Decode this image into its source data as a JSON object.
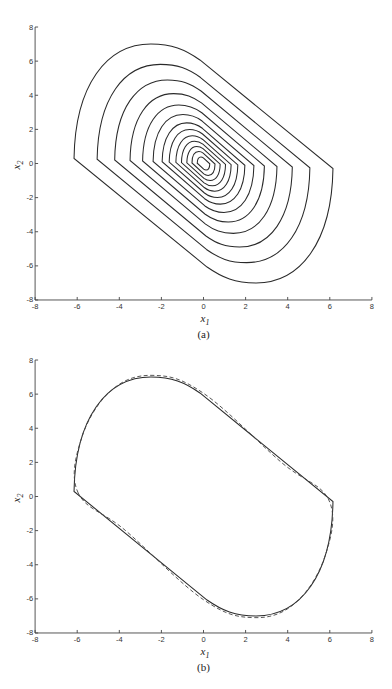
{
  "chart_data": [
    {
      "panel": "a",
      "type": "line",
      "caption": "(a)",
      "title": "",
      "xlabel": "x1",
      "ylabel": "x2",
      "xlim": [
        -8,
        8
      ],
      "ylim": [
        -8,
        8
      ],
      "xticks": [
        -8,
        -6,
        -4,
        -2,
        0,
        2,
        4,
        6,
        8
      ],
      "yticks": [
        -8,
        -6,
        -4,
        -2,
        0,
        2,
        4,
        6,
        8
      ],
      "grid": false,
      "description": "Phase-plane trajectory spiraling into the origin; nested rounded-parallelogram loops tilted along the -45 degree direction",
      "loop_left_extents_x1": [
        -6.15,
        -5.07,
        -4.28,
        -3.57,
        -3.0,
        -2.5,
        -2.09,
        -1.75,
        -1.43,
        -1.15,
        -0.88,
        -0.61,
        -0.32
      ],
      "loop_peak_x2": [
        7.0,
        5.85,
        4.8,
        4.0,
        3.3,
        2.7,
        2.2,
        1.75,
        1.35,
        1.0,
        0.7,
        0.45,
        0.22
      ],
      "series": [
        {
          "name": "trajectory",
          "style": "solid",
          "outer_loop_points": [
            [
              -6.15,
              0.3
            ],
            [
              -2.5,
              7.0
            ],
            [
              -0.17,
              6.07
            ],
            [
              3.63,
              2.06
            ],
            [
              6.15,
              -0.3
            ],
            [
              2.5,
              -7.0
            ],
            [
              0.17,
              -6.07
            ],
            [
              -3.63,
              -2.06
            ]
          ]
        }
      ]
    },
    {
      "panel": "b",
      "type": "line",
      "caption": "(b)",
      "title": "",
      "xlabel": "x1",
      "ylabel": "x2",
      "xlim": [
        -8,
        8
      ],
      "ylim": [
        -8,
        8
      ],
      "xticks": [
        -8,
        -6,
        -4,
        -2,
        0,
        2,
        4,
        6,
        8
      ],
      "yticks": [
        -8,
        -6,
        -4,
        -2,
        0,
        2,
        4,
        6,
        8
      ],
      "grid": false,
      "series": [
        {
          "name": "solid closed curve",
          "style": "solid",
          "points": [
            [
              -6.15,
              0.3
            ],
            [
              -6.0,
              3.5
            ],
            [
              -4.5,
              6.2
            ],
            [
              -2.5,
              7.0
            ],
            [
              -0.17,
              6.07
            ],
            [
              3.63,
              2.06
            ],
            [
              6.0,
              -0.2
            ],
            [
              6.15,
              -0.3
            ],
            [
              6.0,
              -3.5
            ],
            [
              4.5,
              -6.2
            ],
            [
              2.5,
              -7.0
            ],
            [
              0.17,
              -6.07
            ],
            [
              -3.63,
              -2.06
            ],
            [
              -6.0,
              0.2
            ]
          ]
        },
        {
          "name": "dashed closed curve",
          "style": "dashed",
          "points": [
            [
              -5.95,
              0.2
            ],
            [
              -5.8,
              3.4
            ],
            [
              -4.4,
              6.2
            ],
            [
              -2.4,
              7.1
            ],
            [
              0.0,
              6.05
            ],
            [
              3.7,
              2.0
            ],
            [
              5.95,
              -0.2
            ],
            [
              5.8,
              -3.4
            ],
            [
              4.4,
              -6.2
            ],
            [
              2.4,
              -7.1
            ],
            [
              0.0,
              -6.05
            ],
            [
              -3.7,
              -2.0
            ]
          ]
        }
      ]
    }
  ],
  "panels": {
    "a": {
      "caption": "(a)",
      "xlabel_main": "x",
      "xlabel_sub": "1",
      "ylabel_main": "x",
      "ylabel_sub": "2"
    },
    "b": {
      "caption": "(b)",
      "xlabel_main": "x",
      "xlabel_sub": "1",
      "ylabel_main": "x",
      "ylabel_sub": "2"
    }
  },
  "tick_labels": [
    "-8",
    "-6",
    "-4",
    "-2",
    "0",
    "2",
    "4",
    "6",
    "8"
  ],
  "template": {
    "outer": {
      "left": [
        -6.15,
        0.3
      ],
      "top_arc_c1": [
        -6.1,
        4.6
      ],
      "top_arc_c2": [
        -4.6,
        7.0
      ],
      "top": [
        -2.5,
        7.0
      ],
      "top_join_c1": [
        -1.5,
        7.0
      ],
      "top_join_c2": [
        -0.9,
        6.7
      ],
      "line_top_end": [
        -0.17,
        6.07
      ]
    },
    "scales": [
      1.0,
      0.83,
      0.7,
      0.585,
      0.49,
      0.41,
      0.34,
      0.285,
      0.232,
      0.187,
      0.143,
      0.1,
      0.055
    ],
    "colors": {
      "curve": "#2a2a2a",
      "axis": "#444444"
    }
  }
}
